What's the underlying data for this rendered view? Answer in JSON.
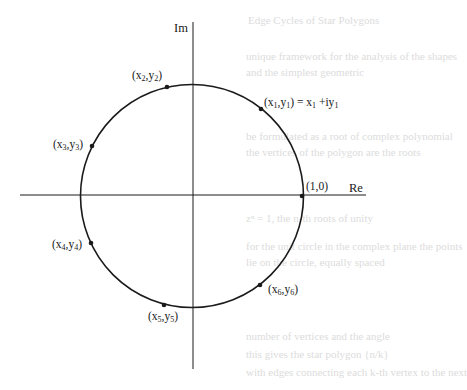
{
  "diagram": {
    "axes": {
      "real_label": "Re",
      "imag_label": "Im"
    },
    "center": {
      "x": 192,
      "y": 196
    },
    "radius": 111,
    "stroke_color": "#1a1a1a",
    "points": [
      {
        "id": "p1",
        "label_main": "(x",
        "sub1": "1",
        "mid": ",y",
        "sub2": "1",
        "tail": ")",
        "extra": " = x",
        "extra_sub": "1",
        "extra_tail": " +iy",
        "extra_sub2": "1",
        "x": 261,
        "y": 109
      },
      {
        "id": "p2",
        "label_main": "(x",
        "sub1": "2",
        "mid": ",y",
        "sub2": "2",
        "tail": ")",
        "x": 167,
        "y": 87
      },
      {
        "id": "p3",
        "label_main": "(x",
        "sub1": "3",
        "mid": ",y",
        "sub2": "3",
        "tail": ")",
        "x": 92,
        "y": 146
      },
      {
        "id": "p4",
        "label_main": "(x",
        "sub1": "4",
        "mid": ",y",
        "sub2": "4",
        "tail": ")",
        "x": 91,
        "y": 243
      },
      {
        "id": "p5",
        "label_main": "(x",
        "sub1": "5",
        "mid": ",y",
        "sub2": "5",
        "tail": ")",
        "x": 164,
        "y": 305
      },
      {
        "id": "p6",
        "label_main": "(x",
        "sub1": "6",
        "mid": ",y",
        "sub2": "6",
        "tail": ")",
        "x": 260,
        "y": 285
      },
      {
        "id": "p0",
        "label_main": "(1,0)",
        "x": 302,
        "y": 196
      }
    ]
  },
  "background_text": [
    "Edge Cycles of Star Polygons",
    "unique framework for the analysis of the shapes",
    "and the simplest geometric",
    "be formulated as a root of complex polynomial",
    "the vertices of the polygon are the roots",
    "zⁿ = 1, the n-th roots of unity",
    "for the unit circle in the complex plane the points",
    "lie on the circle, equally spaced",
    "number of vertices and the angle",
    "this gives the star polygon {n/k}",
    "with edges connecting each k-th vertex to the next"
  ]
}
